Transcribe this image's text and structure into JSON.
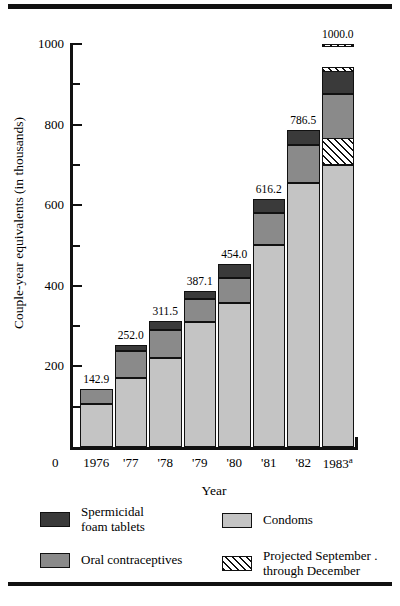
{
  "chart_data": {
    "type": "bar",
    "subtype": "stacked-bar",
    "title": "",
    "xlabel": "Year",
    "ylabel": "Couple-year equivalents (in thousands)",
    "ylim": [
      0,
      1000
    ],
    "yticks": [
      0,
      200,
      400,
      600,
      800,
      1000
    ],
    "yticks_minor": [
      100,
      300,
      500,
      700,
      900
    ],
    "ytick_labels": [
      "0",
      "200",
      "400",
      "600",
      "800",
      "1000"
    ],
    "grid": false,
    "legend_position": "below-axes",
    "categories": [
      "1976",
      "'77",
      "'78",
      "'79",
      "'80",
      "'81",
      "'82",
      "1983"
    ],
    "category_display": [
      "1976",
      "'77",
      "'78",
      "'79",
      "'80",
      "'81",
      "'82",
      "1983a"
    ],
    "footnote_marker": "a",
    "totals": [
      142.9,
      252.0,
      311.5,
      387.1,
      454.0,
      616.2,
      786.5,
      1000.0
    ],
    "total_labels": [
      "142.9",
      "252.0",
      "311.5",
      "387.1",
      "454.0",
      "616.2",
      "786.5",
      "1000.0"
    ],
    "series": [
      {
        "name": "Condoms",
        "color": "#c4c4c4",
        "values": [
          107.0,
          172.0,
          222.0,
          311.0,
          357.0,
          502.0,
          655.0,
          700.0
        ]
      },
      {
        "name": "Oral contraceptives",
        "color": "#8a8a8a",
        "values": [
          35.9,
          65.0,
          67.5,
          55.1,
          62.0,
          78.2,
          95.5,
          176.0
        ]
      },
      {
        "name": "Spermicidal foam tablets",
        "color": "#3a3a3a",
        "values": [
          0.0,
          15.0,
          22.0,
          21.0,
          35.0,
          36.0,
          36.0,
          58.0
        ]
      },
      {
        "name": "Projected September through December",
        "color": "hatched",
        "hatch": "diagonal",
        "values": [
          0.0,
          0.0,
          0.0,
          0.0,
          0.0,
          0.0,
          0.0,
          66.0
        ],
        "note": "Projection applies only to 1983; shown as hatched bands within each product segment"
      }
    ],
    "projection_bands_1983": [
      {
        "segment": "Condoms",
        "from": 700.0,
        "to": 766.0
      },
      {
        "segment": "Oral contraceptives",
        "from": 930.0,
        "to": 942.0
      },
      {
        "segment": "Spermicidal foam tablets",
        "from": 992.0,
        "to": 1000.0
      }
    ]
  },
  "axes": {
    "y_title": "Couple-year equivalents (in thousands)",
    "x_title": "Year",
    "zero_label": "0"
  },
  "legend": {
    "items": [
      {
        "label_line1": "Spermicidal",
        "label_line2": "foam tablets",
        "swatch": "dark"
      },
      {
        "label_line1": "Condoms",
        "label_line2": "",
        "swatch": "light"
      },
      {
        "label_line1": "Oral contraceptives",
        "label_line2": "",
        "swatch": "medium"
      },
      {
        "label_line1": "Projected September .",
        "label_line2": "through December",
        "swatch": "hatched"
      }
    ]
  },
  "colors": {
    "condoms": "#c4c4c4",
    "oral": "#8a8a8a",
    "foam": "#3a3a3a",
    "outline": "#111111",
    "background": "#ffffff"
  }
}
